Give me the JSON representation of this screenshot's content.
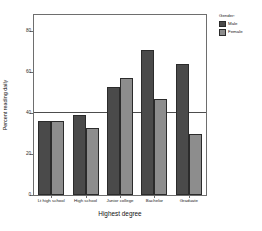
{
  "chart_data": {
    "type": "bar",
    "title": "",
    "xlabel": "Highest degree",
    "ylabel": "Percent reading daily",
    "categories": [
      "Lt high school",
      "High school",
      "Junior college",
      "Bachelor",
      "Graduate"
    ],
    "series": [
      {
        "name": "Male",
        "values": [
          36,
          39,
          53,
          71,
          64
        ],
        "color": "#4a4a4a"
      },
      {
        "name": "Female",
        "values": [
          36,
          33,
          57,
          47,
          30
        ],
        "color": "#8d8d8d"
      }
    ],
    "ylim": [
      0,
      88
    ],
    "yticks": [
      0,
      20,
      40,
      60,
      80
    ],
    "ytick_labels": [
      "0",
      "20",
      "40",
      "60",
      "80"
    ],
    "grid": false,
    "reference_line": {
      "value": 40,
      "color": "#4d4d4d"
    },
    "legend": {
      "title": "Gender:",
      "position": "right",
      "entries": [
        {
          "label": "Male",
          "swatch": "male"
        },
        {
          "label": "Female",
          "swatch": "female"
        }
      ]
    },
    "frame_color": "#6e6e6e",
    "background": "#ffffff"
  }
}
